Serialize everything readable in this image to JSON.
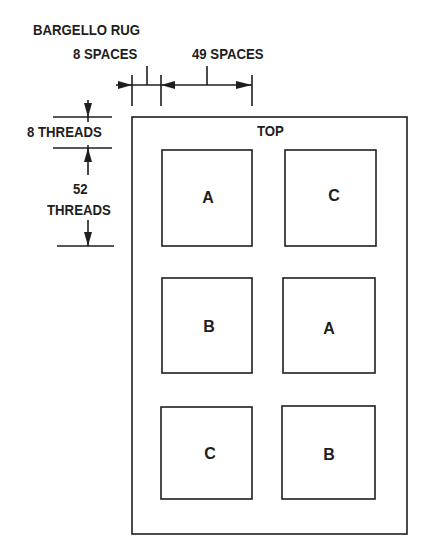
{
  "title": "BARGELLO RUG",
  "dimensions": {
    "horizontal_small": "8 SPACES",
    "horizontal_large": "49 SPACES",
    "vertical_small": "8 THREADS",
    "vertical_large_num": "52",
    "vertical_large_unit": "THREADS"
  },
  "rug": {
    "top_label": "TOP",
    "squares": [
      {
        "row": 1,
        "col": 1,
        "label": "A"
      },
      {
        "row": 1,
        "col": 2,
        "label": "C"
      },
      {
        "row": 2,
        "col": 1,
        "label": "B"
      },
      {
        "row": 2,
        "col": 2,
        "label": "A"
      },
      {
        "row": 3,
        "col": 1,
        "label": "C"
      },
      {
        "row": 3,
        "col": 2,
        "label": "B"
      }
    ]
  },
  "colors": {
    "ink": "#1e1e1e",
    "background": "#ffffff"
  }
}
